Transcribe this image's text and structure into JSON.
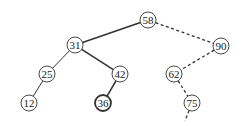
{
  "diagram": {
    "type": "binary-search-tree",
    "nodes": [
      {
        "id": "n58",
        "label": "58",
        "x": 148,
        "y": 20,
        "bold": false
      },
      {
        "id": "n31",
        "label": "31",
        "x": 75,
        "y": 45,
        "bold": false
      },
      {
        "id": "n90",
        "label": "90",
        "x": 221,
        "y": 46,
        "bold": false
      },
      {
        "id": "n25",
        "label": "25",
        "x": 47,
        "y": 74,
        "bold": false
      },
      {
        "id": "n42",
        "label": "42",
        "x": 120,
        "y": 74,
        "bold": false
      },
      {
        "id": "n62",
        "label": "62",
        "x": 174,
        "y": 74,
        "bold": false
      },
      {
        "id": "n12",
        "label": "12",
        "x": 29,
        "y": 103,
        "bold": false
      },
      {
        "id": "n36",
        "label": "36",
        "x": 103,
        "y": 103,
        "bold": true
      },
      {
        "id": "n75",
        "label": "75",
        "x": 192,
        "y": 103,
        "bold": false
      }
    ],
    "edges": [
      {
        "from": "n58",
        "to": "n31",
        "style": "solid-thick"
      },
      {
        "from": "n31",
        "to": "n42",
        "style": "solid-thick"
      },
      {
        "from": "n42",
        "to": "n36",
        "style": "solid-thick"
      },
      {
        "from": "n31",
        "to": "n25",
        "style": "solid"
      },
      {
        "from": "n25",
        "to": "n12",
        "style": "solid"
      },
      {
        "from": "n58",
        "to": "n90",
        "style": "dashed"
      },
      {
        "from": "n90",
        "to": "n62",
        "style": "dashed"
      },
      {
        "from": "n62",
        "to": "n75",
        "style": "dashed"
      },
      {
        "from": "n75",
        "to": "open-end",
        "style": "dashed",
        "end": {
          "x": 185,
          "y": 121
        }
      }
    ],
    "node_radius": 8,
    "colors": {
      "stroke": "#333333",
      "background": "#ffffff",
      "text": "#222222"
    }
  }
}
